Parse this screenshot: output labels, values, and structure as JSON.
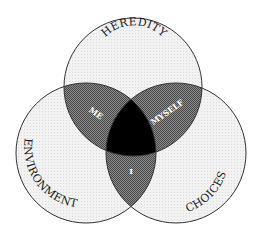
{
  "diagram": {
    "type": "venn-3",
    "circles": [
      {
        "id": "heredity",
        "label": "HEREDITY",
        "cx": 133,
        "cy": 87,
        "r": 69
      },
      {
        "id": "environment",
        "label": "ENVIRONMENT",
        "cx": 86,
        "cy": 153,
        "r": 70
      },
      {
        "id": "choices",
        "label": "CHOICES",
        "cx": 176,
        "cy": 153,
        "r": 70
      }
    ],
    "intersections": {
      "heredity_environment": "ME",
      "heredity_choices": "MYSELF",
      "environment_choices": "I",
      "all_three": ""
    },
    "colors": {
      "circle_fill": "#eeeeee",
      "pair_fill": "#6e6e6e",
      "triple_fill": "#000000",
      "stroke": "#333333",
      "background": "#ffffff"
    }
  }
}
